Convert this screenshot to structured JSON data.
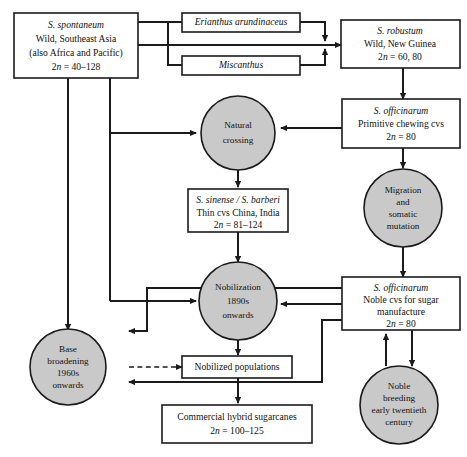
{
  "diagram": {
    "colors": {
      "circle_fill": "#c9c9c9",
      "box_fill": "#ffffff",
      "stroke": "#1b1b1b"
    },
    "nodes": {
      "spontaneum": {
        "shape": "box",
        "line1": "S. spontaneum",
        "line2": "Wild, Southeast Asia",
        "line3": "(also Africa and Pacific)",
        "line4_pre": "2",
        "line4_ital": "n",
        "line4_post": " = 40–128"
      },
      "erianthus": {
        "shape": "box",
        "line1": "Erianthus arundinaceus"
      },
      "miscanthus": {
        "shape": "box",
        "line1": "Miscanthus"
      },
      "robustum": {
        "shape": "box",
        "line1": "S. robustum",
        "line2": "Wild, New Guinea",
        "line3_pre": "2",
        "line3_ital": "n",
        "line3_post": " = 60, 80"
      },
      "natural_crossing": {
        "shape": "circle",
        "line1": "Natural",
        "line2": "crossing"
      },
      "officinarum_primitive": {
        "shape": "box",
        "line1": "S. officinarum",
        "line2": "Primitive chewing cvs",
        "line3_pre": "2",
        "line3_ital": "n",
        "line3_post": " = 80"
      },
      "sinense_barberi": {
        "shape": "box",
        "line1": "S. sinense / S. barberi",
        "line2": "Thin cvs China, India",
        "line3_pre": "2",
        "line3_ital": "n",
        "line3_post": " = 81–124"
      },
      "migration": {
        "shape": "circle",
        "line1": "Migration",
        "line2": "and",
        "line3": "somatic",
        "line4": "mutation"
      },
      "nobilization": {
        "shape": "circle",
        "line1": "Nobilization",
        "line2": "1890s",
        "line3": "onwards"
      },
      "officinarum_noble": {
        "shape": "box",
        "line1": "S. officinarum",
        "line2": "Noble cvs for sugar",
        "line3": "manufacture",
        "line4_pre": "2",
        "line4_ital": "n",
        "line4_post": " = 80"
      },
      "base_broadening": {
        "shape": "circle",
        "line1": "Base",
        "line2": "broadening",
        "line3": "1960s",
        "line4": "onwards"
      },
      "nobilized_populations": {
        "shape": "box",
        "line1": "Nobilized populations"
      },
      "noble_breeding": {
        "shape": "circle",
        "line1": "Noble",
        "line2": "breeding",
        "line3": "early twentieth",
        "line4": "century"
      },
      "commercial": {
        "shape": "box",
        "line1": "Commercial hybrid sugarcanes",
        "line2_pre": "2",
        "line2_ital": "n",
        "line2_post": " = 100–125"
      }
    },
    "edges": [
      {
        "from": "spontaneum",
        "to": "erianthus",
        "style": "solid"
      },
      {
        "from": "spontaneum",
        "to": "miscanthus",
        "style": "solid"
      },
      {
        "from": "spontaneum",
        "to": "robustum",
        "style": "solid",
        "arrow": true
      },
      {
        "from": "erianthus",
        "to": "robustum",
        "style": "solid",
        "arrow": true
      },
      {
        "from": "miscanthus",
        "to": "robustum",
        "style": "solid",
        "arrow": true
      },
      {
        "from": "spontaneum",
        "to": "natural_crossing",
        "style": "solid",
        "arrow": true
      },
      {
        "from": "spontaneum",
        "to": "nobilization",
        "style": "solid",
        "arrow": true
      },
      {
        "from": "spontaneum",
        "to": "base_broadening",
        "style": "solid",
        "arrow": true
      },
      {
        "from": "robustum",
        "to": "officinarum_primitive",
        "style": "solid",
        "arrow": true
      },
      {
        "from": "officinarum_primitive",
        "to": "natural_crossing",
        "style": "solid",
        "arrow": true
      },
      {
        "from": "officinarum_primitive",
        "to": "migration",
        "style": "solid",
        "arrow": true
      },
      {
        "from": "natural_crossing",
        "to": "sinense_barberi",
        "style": "solid",
        "arrow": true
      },
      {
        "from": "sinense_barberi",
        "to": "nobilization",
        "style": "solid",
        "arrow": true
      },
      {
        "from": "migration",
        "to": "officinarum_noble",
        "style": "solid",
        "arrow": true
      },
      {
        "from": "officinarum_noble",
        "to": "nobilization",
        "style": "solid",
        "arrow": true
      },
      {
        "from": "officinarum_noble",
        "to": "noble_breeding",
        "style": "solid",
        "arrow": true
      },
      {
        "from": "noble_breeding",
        "to": "officinarum_noble",
        "style": "solid",
        "arrow": true
      },
      {
        "from": "nobilization",
        "to": "nobilized_populations",
        "style": "solid",
        "arrow": true
      },
      {
        "from": "base_broadening",
        "to": "nobilized_populations",
        "style": "dashed",
        "arrow": true
      },
      {
        "from": "nobilized_populations",
        "to": "commercial",
        "style": "solid",
        "arrow": true
      },
      {
        "from": "officinarum_noble",
        "to": "base_broadening",
        "style": "solid",
        "arrow": true
      },
      {
        "from": "noble_breeding",
        "to": "base_broadening",
        "style": "solid",
        "arrow": true
      }
    ]
  }
}
